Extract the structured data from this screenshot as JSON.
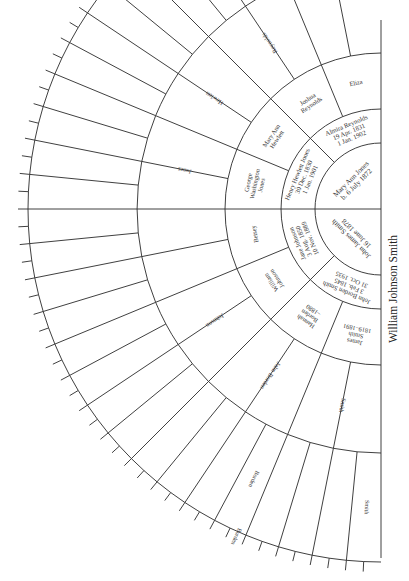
{
  "diagram": {
    "type": "fan-chart",
    "title": "William Johnson Smith",
    "root": {
      "name": "William Johnson Smith"
    },
    "geometry": {
      "center": [
        381,
        209
      ],
      "radii": [
        0,
        66,
        100,
        156,
        244,
        353,
        363
      ],
      "angle_range": [
        -90,
        90
      ]
    },
    "generations": [
      {
        "gen": 1,
        "people": [
          {
            "slot": "father",
            "lines": [
              "John James Smith",
              "16 June 1878"
            ]
          },
          {
            "slot": "mother",
            "lines": [
              "Mary Ann Jones",
              "b. 6 July 1872"
            ]
          }
        ]
      },
      {
        "gen": 2,
        "people": [
          {
            "slot": "ff",
            "lines": [
              "John Borden Smith",
              "3 Feb. 1845",
              "31 Oct. 1935"
            ]
          },
          {
            "slot": "fm",
            "lines": [
              "Jane Johnson",
              "3 Aug. 1850",
              "10 Nov. 1889"
            ]
          },
          {
            "slot": "mf",
            "lines": [
              "Henry Hewlett Jones",
              "30 Dec. 1830",
              "1 Jan. 1901"
            ]
          },
          {
            "slot": "mm",
            "lines": [
              "Almira Reynolds",
              "19 Apr. 1831",
              "1 Jan. 1902"
            ]
          }
        ]
      },
      {
        "gen": 3,
        "people": [
          {
            "slot": "fff",
            "lines": [
              "James",
              "Smith",
              "1819–1891"
            ]
          },
          {
            "slot": "ffm",
            "lines": [
              "Hannah",
              "Borden",
              "–1880"
            ]
          },
          {
            "slot": "fmf",
            "lines": [
              "William",
              "Johnson"
            ]
          },
          {
            "slot": "fmm",
            "lines": [
              "Betsey"
            ]
          },
          {
            "slot": "mff",
            "lines": [
              "George",
              "Washington",
              "Jones"
            ]
          },
          {
            "slot": "mfm",
            "lines": [
              "Mary Ann",
              "Hewlett"
            ]
          },
          {
            "slot": "mmf",
            "lines": [
              "Joshua",
              "Reynolds"
            ]
          },
          {
            "slot": "mmm",
            "lines": [
              "Eliza"
            ]
          }
        ]
      },
      {
        "gen": 4,
        "labels": [
          "Smith",
          "",
          "John Borden",
          "",
          "Johnson",
          "",
          "",
          "",
          "Jones",
          "",
          "Hewlett",
          "",
          "Reynolds",
          "",
          "",
          ""
        ]
      },
      {
        "gen": 5,
        "labels": [
          "Smith",
          "",
          "",
          "",
          "Borden",
          "",
          "",
          "",
          "",
          "",
          "",
          "",
          "",
          "",
          "",
          "",
          "",
          "",
          "",
          "",
          "",
          "",
          "",
          "",
          "",
          "",
          "",
          "",
          "",
          "",
          "",
          ""
        ]
      },
      {
        "gen": 6,
        "labels": [
          "",
          "",
          "",
          "",
          "",
          "",
          "",
          "",
          "Borden"
        ]
      }
    ]
  }
}
